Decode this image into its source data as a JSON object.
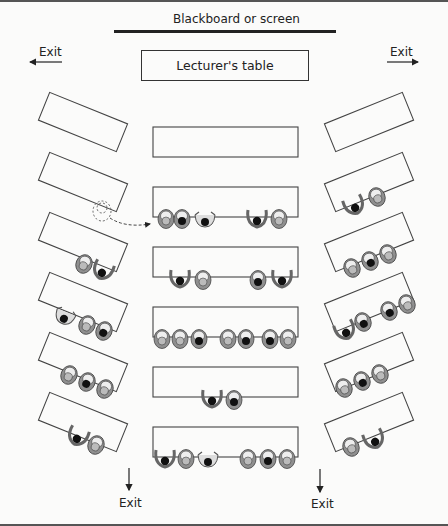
{
  "blackboard_label": "Blackboard or screen",
  "lecturer_table_label": "Lecturer's table",
  "exits": {
    "top_left": "Exit",
    "top_right": "Exit",
    "bottom_left": "Exit",
    "bottom_right": "Exit"
  },
  "colors": {
    "line": "#333333",
    "seat_fill": "#8f8f8f",
    "seat_light": "#e6e6e6",
    "head_dark": "#111111"
  },
  "tables": {
    "left_column": [
      {
        "row": 1,
        "students": 0
      },
      {
        "row": 2,
        "students": 0,
        "note": "dashed student moving to centre row"
      },
      {
        "row": 3,
        "students": 2
      },
      {
        "row": 4,
        "students": 3
      },
      {
        "row": 5,
        "students": 3
      },
      {
        "row": 6,
        "students": 2
      }
    ],
    "centre_column": [
      {
        "row": 1,
        "students": 0
      },
      {
        "row": 2,
        "students": 5
      },
      {
        "row": 3,
        "students": 4
      },
      {
        "row": 4,
        "students": 7
      },
      {
        "row": 5,
        "students": 2
      },
      {
        "row": 6,
        "students": 6
      }
    ],
    "right_column": [
      {
        "row": 1,
        "students": 0
      },
      {
        "row": 2,
        "students": 2
      },
      {
        "row": 3,
        "students": 3
      },
      {
        "row": 4,
        "students": 4
      },
      {
        "row": 5,
        "students": 3
      },
      {
        "row": 6,
        "students": 2
      }
    ]
  }
}
